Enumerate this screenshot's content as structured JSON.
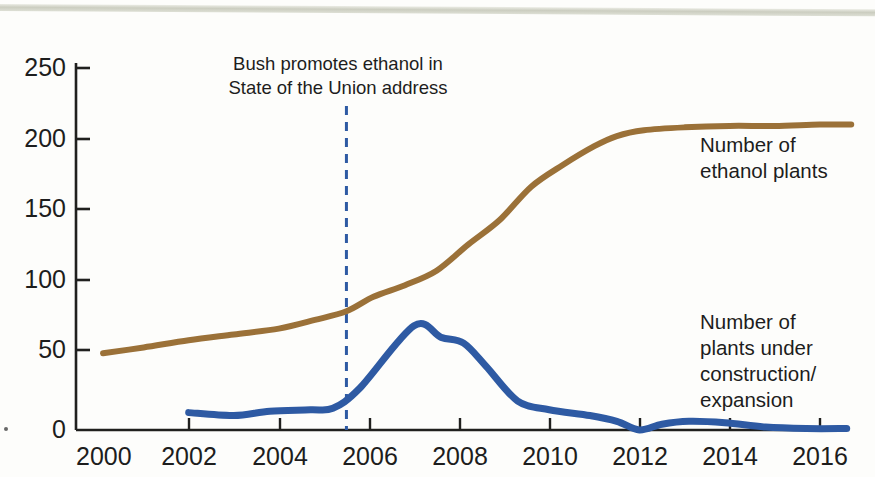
{
  "chart_data": {
    "type": "line",
    "title": "",
    "subtitle": "",
    "xlabel": "",
    "ylabel": "",
    "xlim": [
      2000,
      2017.4
    ],
    "ylim": [
      0,
      250
    ],
    "grid": false,
    "legend_position": "right-inline",
    "x_ticks": [
      "2000",
      "2002",
      "2004",
      "2006",
      "2008",
      "2010",
      "2012",
      "2014",
      "2016"
    ],
    "x_tick_values": [
      2000,
      2002,
      2004,
      2006,
      2008,
      2010,
      2012,
      2014,
      2016
    ],
    "y_ticks": [
      "0",
      "50",
      "100",
      "150",
      "200",
      "250"
    ],
    "y_tick_values": [
      0,
      50,
      100,
      150,
      200,
      250
    ],
    "series": [
      {
        "name": "Number of ethanol plants",
        "color": "#9b7138",
        "label_lines": [
          "Number of",
          "ethanol plants"
        ],
        "x": [
          2000.6,
          2001.5,
          2002.5,
          2003.5,
          2004.5,
          2005.3,
          2006.0,
          2006.6,
          2007.3,
          2008.0,
          2008.7,
          2009.4,
          2010.1,
          2010.8,
          2011.5,
          2012.0,
          2012.6,
          2013.5,
          2014.5,
          2015.5,
          2016.5,
          2017.2
        ],
        "values": [
          53,
          57,
          62,
          66,
          70,
          76,
          82,
          92,
          100,
          110,
          128,
          145,
          168,
          183,
          196,
          203,
          207,
          209,
          210,
          210,
          211,
          211
        ]
      },
      {
        "name": "Number of plants under construction/expansion",
        "color": "#2e5aa3",
        "label_lines": [
          "Number of",
          "plants under",
          "construction/",
          "expansion"
        ],
        "x": [
          2002.5,
          2003.5,
          2004.3,
          2005.2,
          2005.7,
          2006.3,
          2007.5,
          2008.1,
          2008.6,
          2009.1,
          2009.8,
          2010.5,
          2011.4,
          2012.0,
          2012.5,
          2013.0,
          2013.6,
          2014.4,
          2015.3,
          2016.2,
          2017.1
        ],
        "values": [
          12,
          10,
          13,
          14,
          15,
          29,
          72,
          64,
          60,
          44,
          20,
          14,
          10,
          6,
          0,
          4,
          6,
          5,
          2,
          1,
          1
        ]
      }
    ],
    "annotations": [
      {
        "name": "bush-ethanol-annotation",
        "lines": [
          "Bush promotes ethanol in",
          "State of the Union address"
        ],
        "marker_type": "vertical-dashed-line",
        "marker_x": 2006,
        "marker_color": "#2e5aa3",
        "marker_y_top": 250,
        "marker_y_bottom": 0
      }
    ]
  }
}
